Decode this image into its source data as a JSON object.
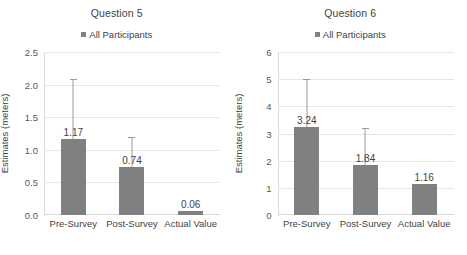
{
  "figure": {
    "panels": [
      "Question 5",
      "Question 6"
    ],
    "bar_color": "#808080",
    "gridline_color": "#e6e6e6",
    "errorbar_color": "#9b9b9b"
  },
  "chart_data": [
    {
      "type": "bar",
      "title": "Question 5",
      "xlabel": "",
      "ylabel": "Estimates (meters)",
      "legend": [
        "All Participants"
      ],
      "legend_position": "top-center",
      "grid": true,
      "ylim": [
        0.0,
        2.5
      ],
      "yticks": [
        "0.0",
        "0.5",
        "1.0",
        "1.5",
        "2.0",
        "2.5"
      ],
      "ytick_values": [
        0.0,
        0.5,
        1.0,
        1.5,
        2.0,
        2.5
      ],
      "categories": [
        "Pre-Survey",
        "Post-Survey",
        "Actual Value"
      ],
      "values": [
        1.17,
        0.74,
        0.06
      ],
      "value_labels": [
        "1.17",
        "0.74",
        "0.06"
      ],
      "error_bars": [
        {
          "low": 0.03,
          "high": 2.09
        },
        {
          "low": 0.23,
          "high": 1.2
        },
        null
      ]
    },
    {
      "type": "bar",
      "title": "Question 6",
      "xlabel": "",
      "ylabel": "Estimates (meters)",
      "legend": [
        "All Participants"
      ],
      "legend_position": "top-center",
      "grid": true,
      "ylim": [
        0,
        6
      ],
      "yticks": [
        "0",
        "1",
        "2",
        "3",
        "4",
        "5",
        "6"
      ],
      "ytick_values": [
        0,
        1,
        2,
        3,
        4,
        5,
        6
      ],
      "categories": [
        "Pre-Survey",
        "Post-Survey",
        "Actual Value"
      ],
      "values": [
        3.24,
        1.84,
        1.16
      ],
      "value_labels": [
        "3.24",
        "1.84",
        "1.16"
      ],
      "error_bars": [
        {
          "low": 1.4,
          "high": 5.0
        },
        {
          "low": 0.5,
          "high": 3.2
        },
        null
      ]
    }
  ]
}
